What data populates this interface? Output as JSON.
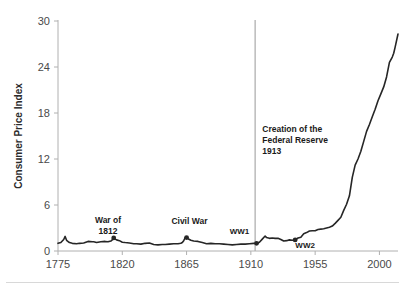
{
  "chart_data": {
    "type": "line",
    "title": "",
    "xlabel": "",
    "ylabel": "Consumer Price Index",
    "xlim": [
      1775,
      2013
    ],
    "ylim": [
      0,
      30
    ],
    "xticks": [
      1775,
      1820,
      1865,
      1910,
      1955,
      2000
    ],
    "xticklabels": [
      "1775",
      "1820",
      "1865",
      "1910",
      "1955",
      "2000"
    ],
    "yticks": [
      0,
      6,
      12,
      18,
      24,
      30
    ],
    "yticklabels": [
      "0",
      "6",
      "12",
      "18",
      "24",
      "30"
    ],
    "grid": false,
    "legend": "none",
    "line_color": "#262626",
    "series": [
      {
        "name": "Consumer Price Index",
        "x": [
          1775,
          1777,
          1779,
          1780,
          1781,
          1783,
          1785,
          1788,
          1790,
          1793,
          1796,
          1799,
          1800,
          1802,
          1805,
          1808,
          1810,
          1812,
          1813,
          1814,
          1815,
          1816,
          1818,
          1820,
          1822,
          1825,
          1828,
          1830,
          1833,
          1836,
          1839,
          1842,
          1845,
          1848,
          1850,
          1853,
          1856,
          1859,
          1861,
          1862,
          1863,
          1864,
          1865,
          1866,
          1868,
          1870,
          1873,
          1876,
          1879,
          1882,
          1885,
          1888,
          1891,
          1894,
          1897,
          1900,
          1903,
          1906,
          1909,
          1912,
          1914,
          1916,
          1918,
          1920,
          1921,
          1923,
          1925,
          1927,
          1929,
          1931,
          1933,
          1935,
          1937,
          1939,
          1941,
          1943,
          1945,
          1947,
          1949,
          1951,
          1953,
          1955,
          1957,
          1959,
          1961,
          1963,
          1965,
          1967,
          1969,
          1971,
          1973,
          1975,
          1977,
          1979,
          1981,
          1983,
          1985,
          1987,
          1989,
          1991,
          1993,
          1995,
          1997,
          1999,
          2001,
          2003,
          2005,
          2007,
          2009,
          2010,
          2011,
          2013
        ],
        "y": [
          1.0,
          1.1,
          1.5,
          1.9,
          1.4,
          1.1,
          1.0,
          0.95,
          1.0,
          1.05,
          1.25,
          1.2,
          1.2,
          1.1,
          1.2,
          1.25,
          1.2,
          1.3,
          1.45,
          1.7,
          1.55,
          1.45,
          1.35,
          1.15,
          1.1,
          1.05,
          0.95,
          0.95,
          0.9,
          1.0,
          1.05,
          0.85,
          0.8,
          0.85,
          0.85,
          0.9,
          0.95,
          0.95,
          1.0,
          1.1,
          1.35,
          1.7,
          1.75,
          1.6,
          1.4,
          1.3,
          1.25,
          1.1,
          0.95,
          1.0,
          0.95,
          0.95,
          0.9,
          0.85,
          0.8,
          0.85,
          0.9,
          0.9,
          0.95,
          1.0,
          1.0,
          1.15,
          1.55,
          1.95,
          1.75,
          1.65,
          1.7,
          1.65,
          1.65,
          1.5,
          1.3,
          1.35,
          1.45,
          1.4,
          1.45,
          1.7,
          1.8,
          2.25,
          2.4,
          2.6,
          2.65,
          2.65,
          2.8,
          2.85,
          2.9,
          3.0,
          3.1,
          3.25,
          3.6,
          4.0,
          4.4,
          5.3,
          6.1,
          7.2,
          9.6,
          11.2,
          12.0,
          13.0,
          14.3,
          15.6,
          16.5,
          17.5,
          18.5,
          19.6,
          20.5,
          21.4,
          22.7,
          24.6,
          25.3,
          25.8,
          26.6,
          28.3
        ]
      }
    ],
    "markers": [
      {
        "label": "war-of-1812",
        "x": 1814,
        "y": 1.7
      },
      {
        "label": "civil-war",
        "x": 1865,
        "y": 1.75
      },
      {
        "label": "ww1",
        "x": 1914,
        "y": 1.0
      },
      {
        "label": "ww2",
        "x": 1941,
        "y": 1.45
      }
    ],
    "vlines": [
      {
        "label": "fed-creation",
        "x": 1913,
        "color": "#b5b5b5"
      }
    ],
    "annotations": [
      {
        "name": "war-of-1812-label",
        "lines": [
          "War of",
          "1812"
        ],
        "x": 1810,
        "y": 3.6,
        "align": "middle"
      },
      {
        "name": "civil-war-label",
        "lines": [
          "Civil War"
        ],
        "x": 1867,
        "y": 3.5,
        "align": "middle"
      },
      {
        "name": "ww1-label",
        "lines": [
          "WW1"
        ],
        "x": 1902,
        "y": 2.2,
        "align": "middle"
      },
      {
        "name": "ww2-label",
        "lines": [
          "WW2"
        ],
        "x": 1948,
        "y": 0.45,
        "align": "middle"
      },
      {
        "name": "fed-reserve-label",
        "lines": [
          "Creation of the",
          "Federal Reserve",
          "1913"
        ],
        "x": 1918,
        "y": 15.5,
        "align": "start"
      }
    ]
  },
  "axis": {
    "y_title": "Consumer Price Index",
    "y_tick_0": "0",
    "y_tick_1": "6",
    "y_tick_2": "12",
    "y_tick_3": "18",
    "y_tick_4": "24",
    "y_tick_5": "30",
    "x_tick_0": "1775",
    "x_tick_1": "1820",
    "x_tick_2": "1865",
    "x_tick_3": "1910",
    "x_tick_4": "1955",
    "x_tick_5": "2000"
  },
  "annotation_text": {
    "war_of_1812_line1": "War of",
    "war_of_1812_line2": "1812",
    "civil_war": "Civil War",
    "ww1": "WW1",
    "ww2": "WW2",
    "fed_line1": "Creation of the",
    "fed_line2": "Federal Reserve",
    "fed_line3": "1913"
  }
}
